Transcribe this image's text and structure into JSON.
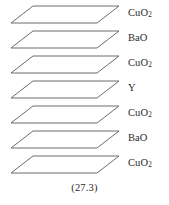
{
  "figure": {
    "caption": "(27.3)",
    "structure_name": "layered-crystal-structure",
    "plane_count": 7,
    "line_color": "#5b5b5b",
    "text_color": "#2b2b2b",
    "background_color": "#ffffff",
    "layers": [
      {
        "index": 0,
        "label_base": "CuO",
        "label_sub": "2",
        "label_plain": "CuO2"
      },
      {
        "index": 1,
        "label_base": "BaO",
        "label_sub": "",
        "label_plain": "BaO"
      },
      {
        "index": 2,
        "label_base": "CuO",
        "label_sub": "2",
        "label_plain": "CuO2"
      },
      {
        "index": 3,
        "label_base": "Y",
        "label_sub": "",
        "label_plain": "Y"
      },
      {
        "index": 4,
        "label_base": "CuO",
        "label_sub": "2",
        "label_plain": "CuO2"
      },
      {
        "index": 5,
        "label_base": "BaO",
        "label_sub": "",
        "label_plain": "BaO"
      },
      {
        "index": 6,
        "label_base": "CuO",
        "label_sub": "2",
        "label_plain": "CuO2"
      }
    ]
  }
}
